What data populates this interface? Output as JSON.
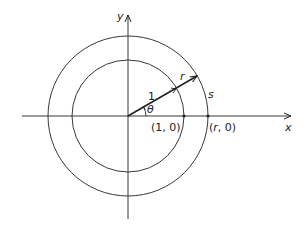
{
  "diagram": {
    "title": "",
    "colors": {
      "background": "#ffffff",
      "stroke": "#222222"
    },
    "labels": {
      "x_axis": "x",
      "y_axis": "y",
      "unit_radius": "1",
      "radius_r": "r",
      "arc_s": "s",
      "angle": "θ",
      "point_unit": "(1, 0)",
      "point_r_prefix": "(",
      "point_r_var": "r",
      "point_r_suffix": ", 0)"
    },
    "geometry": {
      "center": [
        128,
        116
      ],
      "inner_radius": 56,
      "outer_radius": 80,
      "angle_deg": 30
    }
  }
}
